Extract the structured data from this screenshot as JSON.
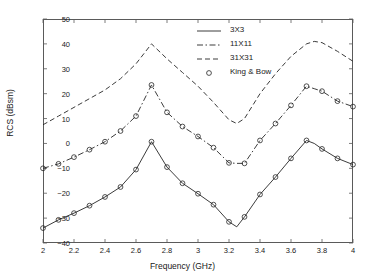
{
  "chart_data": {
    "type": "line",
    "title": "",
    "xlabel": "Frequency (GHz)",
    "ylabel": "RCS (dBsm)",
    "xlim": [
      2,
      4
    ],
    "ylim": [
      -40,
      50
    ],
    "xticks": [
      "2",
      "2.2",
      "2.4",
      "2.6",
      "2.8",
      "3",
      "3.2",
      "3.4",
      "3.6",
      "3.8",
      "4"
    ],
    "yticks": [
      "50",
      "40",
      "30",
      "20",
      "10",
      "0",
      "-10",
      "-20",
      "-30",
      "-40"
    ],
    "grid": false,
    "legend_position": "top-center",
    "x": [
      2.0,
      2.1,
      2.2,
      2.3,
      2.4,
      2.5,
      2.6,
      2.7,
      2.8,
      2.9,
      3.0,
      3.1,
      3.2,
      3.25,
      3.3,
      3.4,
      3.5,
      3.6,
      3.7,
      3.75,
      3.8,
      3.9,
      4.0
    ],
    "series": [
      {
        "name": "3X3",
        "style": "solid",
        "values": [
          -34.0,
          -30.7,
          -28.0,
          -25.0,
          -21.5,
          -17.5,
          -10.5,
          0.7,
          -9.5,
          -16.0,
          -20.2,
          -24.6,
          -31.5,
          -33.5,
          -29.5,
          -20.5,
          -13.5,
          -6.0,
          1.2,
          0.0,
          -2.2,
          -6.0,
          -8.5
        ]
      },
      {
        "name": "11X11",
        "style": "dash-dot",
        "values": [
          -10.0,
          -8.2,
          -5.5,
          -2.5,
          0.7,
          5.0,
          11.0,
          23.5,
          12.5,
          6.8,
          2.8,
          -1.7,
          -7.8,
          -8.0,
          -8.0,
          1.2,
          8.0,
          15.3,
          23.0,
          22.0,
          21.0,
          17.0,
          14.8
        ]
      },
      {
        "name": "31X31",
        "style": "dashed",
        "values": [
          7.5,
          11.0,
          14.5,
          18.0,
          21.5,
          26.0,
          32.0,
          40.0,
          34.0,
          28.5,
          23.0,
          16.5,
          9.5,
          8.0,
          10.0,
          20.0,
          28.0,
          35.0,
          40.0,
          41.0,
          40.5,
          37.0,
          33.0
        ]
      }
    ],
    "markers": {
      "name": "King & Bow",
      "symbol": "circle",
      "x": [
        2.0,
        2.1,
        2.2,
        2.3,
        2.4,
        2.5,
        2.6,
        2.7,
        2.8,
        2.9,
        3.0,
        3.1,
        3.2,
        3.3,
        3.4,
        3.5,
        3.6,
        3.7,
        3.8,
        3.9,
        4.0
      ],
      "series_3x3": [
        -34.0,
        -30.7,
        -28.0,
        -25.0,
        -21.5,
        -17.5,
        -10.5,
        0.7,
        -9.5,
        -16.0,
        -20.2,
        -24.6,
        -31.5,
        -29.5,
        -20.5,
        -13.5,
        -6.0,
        1.2,
        -2.2,
        -6.0,
        -8.5
      ],
      "series_11x11": [
        -10.0,
        -8.2,
        -5.5,
        -2.5,
        0.7,
        5.0,
        11.0,
        23.5,
        12.5,
        6.8,
        2.8,
        -1.7,
        -7.8,
        -8.0,
        1.2,
        8.0,
        15.3,
        23.0,
        21.0,
        17.0,
        14.8
      ]
    },
    "legend": [
      {
        "label": "3X3",
        "style": "solid"
      },
      {
        "label": "11X11",
        "style": "dash-dot"
      },
      {
        "label": "31X31",
        "style": "dashed"
      },
      {
        "label": "King & Bow",
        "style": "marker"
      }
    ],
    "colors": {
      "line": "#262626",
      "axis": "#5a5a5a",
      "background": "#ffffff"
    }
  }
}
